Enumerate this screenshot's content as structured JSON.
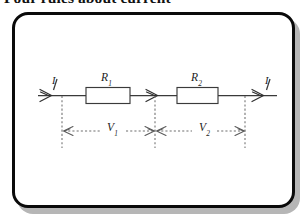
{
  "heading": {
    "text": "Four rules about current"
  },
  "figure": {
    "caption": "",
    "circuit": {
      "type": "series-resistor-circuit",
      "components": [
        {
          "id": "r1",
          "label": "R",
          "subscript": "1",
          "kind": "resistor"
        },
        {
          "id": "r2",
          "label": "R",
          "subscript": "2",
          "kind": "resistor"
        }
      ],
      "currents": [
        {
          "id": "i-left",
          "label": "I",
          "position": "left",
          "direction": "right"
        },
        {
          "id": "i-right",
          "label": "I",
          "position": "right",
          "direction": "right"
        }
      ],
      "voltages": [
        {
          "id": "v1",
          "label": "V",
          "subscript": "1",
          "across": "r1"
        },
        {
          "id": "v2",
          "label": "V",
          "subscript": "2",
          "across": "r2"
        }
      ],
      "wire_arrows": [
        {
          "id": "arrow-left",
          "direction": "right"
        },
        {
          "id": "arrow-middle",
          "direction": "right"
        },
        {
          "id": "arrow-right",
          "direction": "right"
        }
      ]
    }
  },
  "colors": {
    "panel_border": "#0a0a0a",
    "panel_background": "#ffffff",
    "panel_shadow": "#b6b6b6",
    "wire": "#3a3a3a",
    "dimension": "#6e6e6e",
    "text": "#1d1d1d",
    "page_background": "#ffffff"
  }
}
